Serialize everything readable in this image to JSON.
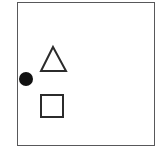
{
  "figure": {
    "title": "",
    "background_color": "#ffffff",
    "frame": {
      "name": "figure-border",
      "x": 17,
      "y": 2,
      "width": 138,
      "height": 144,
      "stroke_color": "#58585a",
      "stroke_width": 1.5,
      "fill_color": "#ffffff"
    },
    "shapes": [
      {
        "name": "filled-circle",
        "kind": "circle",
        "label": "circle",
        "fill_color": "#111111",
        "stroke_color": "#111111",
        "stroke_width": 0,
        "center_x": 26,
        "center_y": 79,
        "radius": 7
      },
      {
        "name": "outlined-triangle",
        "kind": "triangle",
        "label": "triangle",
        "fill_color": "none",
        "stroke_color": "#2b2b2b",
        "stroke_width": 2,
        "apex_x": 53,
        "apex_y": 47,
        "base_left_x": 41,
        "base_right_x": 66,
        "base_y": 71
      },
      {
        "name": "outlined-square",
        "kind": "square",
        "label": "square",
        "fill_color": "none",
        "stroke_color": "#2b2b2b",
        "stroke_width": 2,
        "x": 41,
        "y": 95,
        "width": 22,
        "height": 22
      }
    ]
  }
}
